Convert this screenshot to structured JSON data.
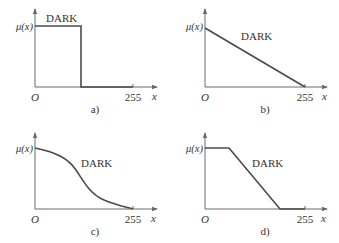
{
  "figure": {
    "panels": [
      {
        "id": "a",
        "caption": "a)",
        "shape": "step",
        "curve_label": "DARK",
        "y_label": "μ(x)",
        "origin_label": "O",
        "x_tick_label": "255",
        "x_axis_label": "x"
      },
      {
        "id": "b",
        "caption": "b)",
        "shape": "linear-decreasing",
        "curve_label": "DARK",
        "y_label": "μ(x)",
        "origin_label": "O",
        "x_tick_label": "255",
        "x_axis_label": "x"
      },
      {
        "id": "c",
        "caption": "c)",
        "shape": "sigmoid-decreasing",
        "curve_label": "DARK",
        "y_label": "μ(x)",
        "origin_label": "O",
        "x_tick_label": "255",
        "x_axis_label": "x"
      },
      {
        "id": "d",
        "caption": "d)",
        "shape": "trapezoid-decreasing",
        "curve_label": "DARK",
        "y_label": "μ(x)",
        "origin_label": "O",
        "x_tick_label": "255",
        "x_axis_label": "x"
      }
    ],
    "colors": {
      "axis": "#6a6a6a",
      "curve": "#4a4a4a",
      "text": "#333333",
      "background": "#ffffff"
    }
  }
}
